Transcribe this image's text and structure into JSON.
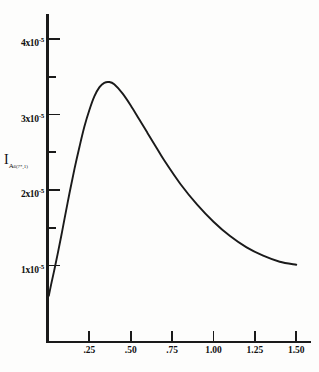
{
  "chart_data": {
    "type": "line",
    "title": "",
    "xlabel": "",
    "ylabel": "I_A6(7*,1)",
    "ylabel_main": "I",
    "ylabel_sub": "A",
    "ylabel_subsub": "6(7*,1)",
    "xlim": [
      0,
      1.6
    ],
    "ylim": [
      0,
      4.4e-05
    ],
    "grid": false,
    "legend": null,
    "line_color": "#1a1a1a",
    "axis_color": "#1a1a1a",
    "x_ticks": [
      {
        "value": 0.25,
        "label": ".25"
      },
      {
        "value": 0.5,
        "label": ".50"
      },
      {
        "value": 0.75,
        "label": ".75"
      },
      {
        "value": 1.0,
        "label": "1.00"
      },
      {
        "value": 1.25,
        "label": "1.25"
      },
      {
        "value": 1.5,
        "label": "1.50"
      }
    ],
    "y_ticks": [
      {
        "value": 4e-05,
        "label": "4x10",
        "exp": "-5",
        "major": true
      },
      {
        "value": 3.5e-05,
        "label": "",
        "exp": "",
        "major": false
      },
      {
        "value": 3e-05,
        "label": "3x10",
        "exp": "-5",
        "major": true
      },
      {
        "value": 2.5e-05,
        "label": "",
        "exp": "",
        "major": false
      },
      {
        "value": 2e-05,
        "label": "2x10",
        "exp": "-5",
        "major": true
      },
      {
        "value": 1.5e-05,
        "label": "",
        "exp": "",
        "major": false
      },
      {
        "value": 1e-05,
        "label": "1x10",
        "exp": "-5",
        "major": true
      }
    ],
    "x": [
      0.005,
      0.02,
      0.04,
      0.06,
      0.08,
      0.1,
      0.13,
      0.16,
      0.19,
      0.22,
      0.25,
      0.28,
      0.31,
      0.34,
      0.37,
      0.4,
      0.45,
      0.5,
      0.55,
      0.6,
      0.65,
      0.7,
      0.8,
      0.9,
      1.0,
      1.1,
      1.2,
      1.3,
      1.4,
      1.5
    ],
    "y": [
      6e-06,
      7.6e-06,
      9.6e-06,
      1.17e-05,
      1.39e-05,
      1.62e-05,
      1.96e-05,
      2.28e-05,
      2.57e-05,
      2.84e-05,
      3.06e-05,
      3.24e-05,
      3.36e-05,
      3.42e-05,
      3.43e-05,
      3.4e-05,
      3.28e-05,
      3.12e-05,
      2.94e-05,
      2.76e-05,
      2.58e-05,
      2.4e-05,
      2.08e-05,
      1.81e-05,
      1.58e-05,
      1.39e-05,
      1.24e-05,
      1.13e-05,
      1.05e-05,
      1.01e-05
    ],
    "peak": {
      "x": 0.37,
      "y": 3.43e-05
    }
  }
}
